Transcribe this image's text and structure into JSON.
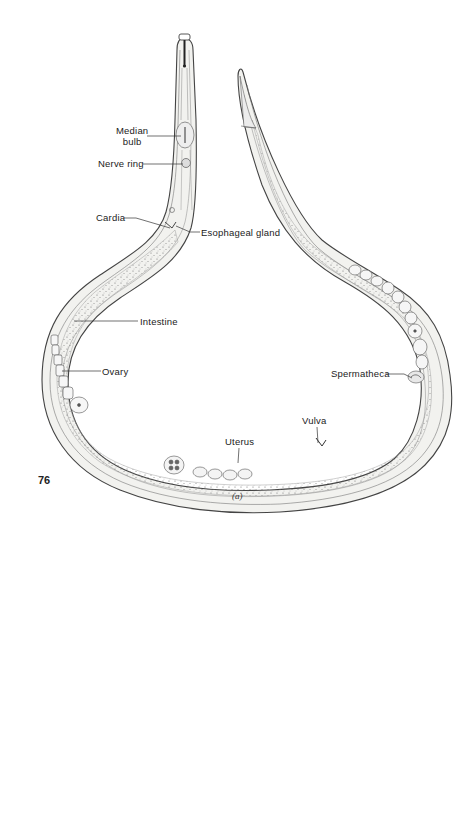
{
  "figure": {
    "caption": "(a)",
    "page_number": "76",
    "labels": {
      "median_bulb": [
        "Median",
        "bulb"
      ],
      "nerve_ring": "Nerve ring",
      "cardia": "Cardia",
      "esophageal_gland": "Esophageal gland",
      "intestine": "Intestine",
      "ovary": "Ovary",
      "spermatheca": "Spermatheca",
      "vulva": "Vulva",
      "uterus": "Uterus"
    }
  },
  "colors": {
    "outline": "#444444",
    "fill": "#f1f1ef",
    "stipple": "#555555",
    "background": "#ffffff"
  }
}
